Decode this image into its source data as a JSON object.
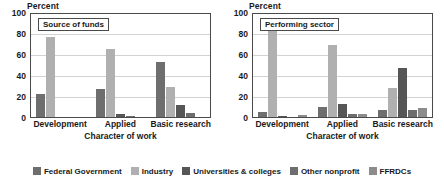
{
  "legend": {
    "items": [
      {
        "label": "Federal Government",
        "color": "#6e6e6e"
      },
      {
        "label": "Industry",
        "color": "#b0b0b0"
      },
      {
        "label": "Universities & colleges",
        "color": "#565656"
      },
      {
        "label": "Other nonprofit",
        "color": "#6e6e6e"
      },
      {
        "label": "FFRDCs",
        "color": "#8c8c8c"
      }
    ]
  },
  "chart_data": [
    {
      "type": "bar",
      "title": "Source of funds",
      "ylabel": "Percent",
      "xlabel": "Character of work",
      "categories": [
        "Development",
        "Applied",
        "Basic research"
      ],
      "ylim": [
        0,
        100
      ],
      "yticks": [
        0,
        20,
        40,
        60,
        80,
        100
      ],
      "grid": true,
      "legend_position": "bottom",
      "series": [
        {
          "name": "Federal Government",
          "color": "#6e6e6e",
          "values": [
            22,
            27,
            52
          ]
        },
        {
          "name": "Industry",
          "color": "#b0b0b0",
          "values": [
            76,
            65,
            29
          ]
        },
        {
          "name": "Universities & colleges",
          "color": "#565656",
          "values": [
            0,
            3,
            11
          ]
        },
        {
          "name": "Other nonprofit",
          "color": "#6e6e6e",
          "values": [
            0,
            1,
            4
          ]
        },
        {
          "name": "FFRDCs",
          "color": "#8c8c8c",
          "values": [
            0,
            0,
            0
          ]
        }
      ]
    },
    {
      "type": "bar",
      "title": "Performing sector",
      "ylabel": "Percent",
      "xlabel": "Character of work",
      "categories": [
        "Development",
        "Applied",
        "Basic research"
      ],
      "ylim": [
        0,
        100
      ],
      "yticks": [
        0,
        20,
        40,
        60,
        80,
        100
      ],
      "grid": true,
      "legend_position": "bottom",
      "series": [
        {
          "name": "Federal Government",
          "color": "#6e6e6e",
          "values": [
            5,
            10,
            7
          ]
        },
        {
          "name": "Industry",
          "color": "#b0b0b0",
          "values": [
            88,
            69,
            28
          ]
        },
        {
          "name": "Universities & colleges",
          "color": "#565656",
          "values": [
            1,
            12,
            47
          ]
        },
        {
          "name": "Other nonprofit",
          "color": "#6e6e6e",
          "values": [
            0,
            3,
            7
          ]
        },
        {
          "name": "FFRDCs",
          "color": "#8c8c8c",
          "values": [
            2,
            3,
            9
          ]
        }
      ]
    }
  ]
}
